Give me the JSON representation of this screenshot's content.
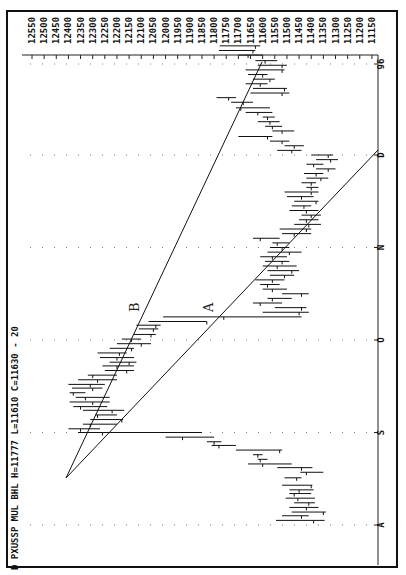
{
  "header": {
    "text": "D PXUSSP MUL BHL H=11777 L=11610 C=11630 - 20"
  },
  "chart_data": {
    "type": "bar",
    "subtype": "ohlc-range-bars (rotated 90° clockwise)",
    "title": "D PXUSSP MUL BHL H=11777 L=11610 C=11630 - 20",
    "price_axis": {
      "ticks": [
        12550,
        12500,
        12450,
        12400,
        12350,
        12300,
        12250,
        12200,
        12150,
        12100,
        12050,
        12000,
        11950,
        11900,
        11850,
        11800,
        11750,
        11700,
        11650,
        11600,
        11550,
        11500,
        11450,
        11400,
        11350,
        11300,
        11250,
        11200,
        11150
      ],
      "range": [
        11150,
        12550
      ]
    },
    "time_axis": {
      "ticks": [
        "A",
        "S",
        "O",
        "N",
        "D",
        "96"
      ]
    },
    "trendlines": [
      {
        "label": "A",
        "from": {
          "time_idx": 0.55,
          "price": 12405
        },
        "to": {
          "time_idx": 4.0,
          "price": 11150
        }
      },
      {
        "label": "B",
        "from": {
          "time_idx": 0.55,
          "price": 12405
        },
        "to": {
          "time_idx": 5.05,
          "price": 11640
        }
      }
    ],
    "bars": [
      {
        "t": 0.05,
        "high": 11545,
        "low": 11345,
        "close": 11390
      },
      {
        "t": 0.1,
        "high": 11520,
        "low": 11410,
        "close": 11440
      },
      {
        "t": 0.14,
        "high": 11480,
        "low": 11340,
        "close": 11350
      },
      {
        "t": 0.19,
        "high": 11490,
        "low": 11370,
        "close": 11420
      },
      {
        "t": 0.24,
        "high": 11470,
        "low": 11385,
        "close": 11410
      },
      {
        "t": 0.29,
        "high": 11505,
        "low": 11385,
        "close": 11455
      },
      {
        "t": 0.34,
        "high": 11490,
        "low": 11400,
        "close": 11470
      },
      {
        "t": 0.38,
        "high": 11490,
        "low": 11390,
        "close": 11450
      },
      {
        "t": 0.43,
        "high": 11520,
        "low": 11395,
        "close": 11400
      },
      {
        "t": 0.51,
        "high": 11510,
        "low": 11440,
        "close": 11460
      },
      {
        "t": 0.57,
        "high": 11445,
        "low": 11350,
        "close": 11420
      },
      {
        "t": 0.62,
        "high": 11540,
        "low": 11395,
        "close": 11440
      },
      {
        "t": 0.66,
        "high": 11660,
        "low": 11480,
        "close": 11600
      },
      {
        "t": 0.71,
        "high": 11620,
        "low": 11580,
        "close": 11610
      },
      {
        "t": 0.76,
        "high": 11640,
        "low": 11600,
        "close": 11620
      },
      {
        "t": 0.81,
        "high": 11710,
        "low": 11520,
        "close": 11530
      },
      {
        "t": 0.86,
        "high": 11810,
        "low": 11710,
        "close": 11780
      },
      {
        "t": 0.9,
        "high": 11830,
        "low": 11770,
        "close": 11800
      },
      {
        "t": 0.95,
        "high": 12000,
        "low": 11800,
        "close": 11930
      },
      {
        "t": 1.0,
        "high": 12360,
        "low": 11850,
        "close": 12260
      },
      {
        "t": 1.04,
        "high": 12400,
        "low": 12270,
        "close": 12350
      },
      {
        "t": 1.09,
        "high": 12340,
        "low": 12200,
        "close": 12310
      },
      {
        "t": 1.14,
        "high": 12310,
        "low": 12175,
        "close": 12180
      },
      {
        "t": 1.19,
        "high": 12290,
        "low": 12200,
        "close": 12280
      },
      {
        "t": 1.24,
        "high": 12340,
        "low": 12170,
        "close": 12220
      },
      {
        "t": 1.28,
        "high": 12380,
        "low": 12240,
        "close": 12350
      },
      {
        "t": 1.33,
        "high": 12395,
        "low": 12230,
        "close": 12300
      },
      {
        "t": 1.38,
        "high": 12370,
        "low": 12230,
        "close": 12330
      },
      {
        "t": 1.43,
        "high": 12395,
        "low": 12330,
        "close": 12380
      },
      {
        "t": 1.48,
        "high": 12385,
        "low": 12260,
        "close": 12300
      },
      {
        "t": 1.52,
        "high": 12400,
        "low": 12250,
        "close": 12310
      },
      {
        "t": 1.57,
        "high": 12360,
        "low": 12200,
        "close": 12280
      },
      {
        "t": 1.62,
        "high": 12320,
        "low": 12200,
        "close": 12300
      },
      {
        "t": 1.67,
        "high": 12250,
        "low": 12130,
        "close": 12160
      },
      {
        "t": 1.72,
        "high": 12260,
        "low": 12130,
        "close": 12200
      },
      {
        "t": 1.76,
        "high": 12230,
        "low": 12120,
        "close": 12150
      },
      {
        "t": 1.81,
        "high": 12270,
        "low": 12130,
        "close": 12200
      },
      {
        "t": 1.86,
        "high": 12280,
        "low": 12160,
        "close": 12190
      },
      {
        "t": 1.91,
        "high": 12230,
        "low": 12130,
        "close": 12140
      },
      {
        "t": 1.96,
        "high": 12200,
        "low": 12060,
        "close": 12100
      },
      {
        "t": 2.01,
        "high": 12180,
        "low": 12100,
        "close": 12140
      },
      {
        "t": 2.06,
        "high": 12130,
        "low": 12040,
        "close": 12060
      },
      {
        "t": 2.12,
        "high": 12110,
        "low": 12030,
        "close": 12050
      },
      {
        "t": 2.16,
        "high": 12120,
        "low": 12020,
        "close": 12040
      },
      {
        "t": 2.2,
        "high": 12070,
        "low": 11830,
        "close": 11830
      },
      {
        "t": 2.25,
        "high": 12010,
        "low": 11440,
        "close": 11760
      },
      {
        "t": 2.3,
        "high": 11600,
        "low": 11410,
        "close": 11450
      },
      {
        "t": 2.35,
        "high": 11550,
        "low": 11420,
        "close": 11440
      },
      {
        "t": 2.4,
        "high": 11640,
        "low": 11520,
        "close": 11610
      },
      {
        "t": 2.45,
        "high": 11580,
        "low": 11480,
        "close": 11560
      },
      {
        "t": 2.5,
        "high": 11520,
        "low": 11410,
        "close": 11440
      },
      {
        "t": 2.55,
        "high": 11600,
        "low": 11500,
        "close": 11560
      },
      {
        "t": 2.6,
        "high": 11610,
        "low": 11530,
        "close": 11580
      },
      {
        "t": 2.65,
        "high": 11630,
        "low": 11510,
        "close": 11560
      },
      {
        "t": 2.7,
        "high": 11570,
        "low": 11470,
        "close": 11510
      },
      {
        "t": 2.75,
        "high": 11580,
        "low": 11450,
        "close": 11480
      },
      {
        "t": 2.8,
        "high": 11600,
        "low": 11460,
        "close": 11540
      },
      {
        "t": 2.85,
        "high": 11590,
        "low": 11490,
        "close": 11520
      },
      {
        "t": 2.9,
        "high": 11610,
        "low": 11500,
        "close": 11560
      },
      {
        "t": 2.95,
        "high": 11580,
        "low": 11440,
        "close": 11490
      },
      {
        "t": 3.0,
        "high": 11570,
        "low": 11490,
        "close": 11520
      },
      {
        "t": 3.05,
        "high": 11560,
        "low": 11490,
        "close": 11540
      },
      {
        "t": 3.1,
        "high": 11640,
        "low": 11530,
        "close": 11610
      },
      {
        "t": 3.15,
        "high": 11520,
        "low": 11400,
        "close": 11470
      },
      {
        "t": 3.2,
        "high": 11530,
        "low": 11400,
        "close": 11420
      },
      {
        "t": 3.25,
        "high": 11470,
        "low": 11360,
        "close": 11410
      },
      {
        "t": 3.3,
        "high": 11450,
        "low": 11370,
        "close": 11420
      },
      {
        "t": 3.35,
        "high": 11440,
        "low": 11360,
        "close": 11400
      },
      {
        "t": 3.4,
        "high": 11490,
        "low": 11370,
        "close": 11420
      },
      {
        "t": 3.45,
        "high": 11480,
        "low": 11400,
        "close": 11430
      },
      {
        "t": 3.5,
        "high": 11470,
        "low": 11370,
        "close": 11380
      },
      {
        "t": 3.55,
        "high": 11500,
        "low": 11390,
        "close": 11440
      },
      {
        "t": 3.6,
        "high": 11510,
        "low": 11370,
        "close": 11400
      },
      {
        "t": 3.65,
        "high": 11420,
        "low": 11370,
        "close": 11400
      },
      {
        "t": 3.7,
        "high": 11440,
        "low": 11380,
        "close": 11400
      },
      {
        "t": 3.75,
        "high": 11420,
        "low": 11330,
        "close": 11360
      },
      {
        "t": 3.8,
        "high": 11430,
        "low": 11350,
        "close": 11380
      },
      {
        "t": 3.85,
        "high": 11380,
        "low": 11300,
        "close": 11330
      },
      {
        "t": 3.9,
        "high": 11420,
        "low": 11350,
        "close": 11390
      },
      {
        "t": 3.95,
        "high": 11380,
        "low": 11290,
        "close": 11320
      },
      {
        "t": 4.0,
        "high": 11400,
        "low": 11310,
        "close": 11330
      },
      {
        "t": 4.05,
        "high": 11540,
        "low": 11440,
        "close": 11480
      },
      {
        "t": 4.1,
        "high": 11510,
        "low": 11430,
        "close": 11470
      },
      {
        "t": 4.15,
        "high": 11570,
        "low": 11490,
        "close": 11520
      },
      {
        "t": 4.2,
        "high": 11700,
        "low": 11560,
        "close": 11580
      },
      {
        "t": 4.26,
        "high": 11560,
        "low": 11470,
        "close": 11520
      },
      {
        "t": 4.31,
        "high": 11590,
        "low": 11520,
        "close": 11560
      },
      {
        "t": 4.36,
        "high": 11620,
        "low": 11530,
        "close": 11570
      },
      {
        "t": 4.41,
        "high": 11600,
        "low": 11550,
        "close": 11580
      },
      {
        "t": 4.46,
        "high": 11670,
        "low": 11560,
        "close": 11620
      },
      {
        "t": 4.51,
        "high": 11710,
        "low": 11570,
        "close": 11690
      },
      {
        "t": 4.57,
        "high": 11730,
        "low": 11640,
        "close": 11680
      },
      {
        "t": 4.62,
        "high": 11790,
        "low": 11710,
        "close": 11740
      },
      {
        "t": 4.67,
        "high": 11650,
        "low": 11490,
        "close": 11520
      },
      {
        "t": 4.72,
        "high": 11640,
        "low": 11500,
        "close": 11510
      },
      {
        "t": 4.77,
        "high": 11670,
        "low": 11580,
        "close": 11610
      },
      {
        "t": 4.82,
        "high": 11640,
        "low": 11550,
        "close": 11570
      },
      {
        "t": 4.87,
        "high": 11660,
        "low": 11580,
        "close": 11600
      },
      {
        "t": 4.92,
        "high": 11670,
        "low": 11510,
        "close": 11520
      },
      {
        "t": 4.97,
        "high": 11620,
        "low": 11500,
        "close": 11520
      },
      {
        "t": 5.02,
        "high": 11630,
        "low": 11540,
        "close": 11590
      },
      {
        "t": 5.08,
        "high": 11700,
        "low": 11600,
        "close": 11660
      },
      {
        "t": 5.13,
        "high": 11780,
        "low": 11630,
        "close": 11640
      },
      {
        "t": 5.18,
        "high": 11777,
        "low": 11610,
        "close": 11630
      }
    ]
  }
}
